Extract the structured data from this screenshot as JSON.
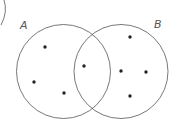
{
  "diagram": {
    "type": "venn",
    "sets": [
      {
        "label": "A",
        "cx": 63.5,
        "cy": 71.5,
        "r": 47,
        "label_x": 20,
        "label_y": 29
      },
      {
        "label": "B",
        "cx": 121,
        "cy": 71.5,
        "r": 47,
        "label_x": 154,
        "label_y": 28
      }
    ],
    "regions": {
      "A_only": 3,
      "A_and_B": 1,
      "B_only": 4
    },
    "points": [
      {
        "x": 45,
        "y": 47,
        "region": "A_only"
      },
      {
        "x": 34,
        "y": 82,
        "region": "A_only"
      },
      {
        "x": 64,
        "y": 93,
        "region": "A_only"
      },
      {
        "x": 84,
        "y": 66,
        "region": "A_and_B"
      },
      {
        "x": 130,
        "y": 37,
        "region": "B_only"
      },
      {
        "x": 121,
        "y": 71,
        "region": "B_only"
      },
      {
        "x": 146,
        "y": 72,
        "region": "B_only"
      },
      {
        "x": 130,
        "y": 96,
        "region": "B_only"
      }
    ],
    "colors": {
      "stroke": "#555555",
      "dot": "#222222",
      "label": "#555555"
    }
  }
}
